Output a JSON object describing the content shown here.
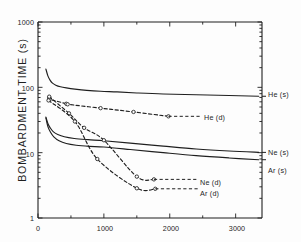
{
  "chart_data": {
    "type": "line",
    "title": "",
    "xlabel": "",
    "ylabel": "BOMBARDMENT TIME (s)",
    "xlim": [
      0,
      3400
    ],
    "ylim": [
      1,
      1000
    ],
    "yscale": "log",
    "xscale": "linear",
    "grid": false,
    "legend_position": "right-inline",
    "xticks": [
      0,
      1000,
      2000,
      3000
    ],
    "xtick_labels": [
      "0",
      "1000",
      "2000",
      "3000"
    ],
    "yticks": [
      1,
      10,
      100,
      1000
    ],
    "ytick_labels": [
      "1",
      "10",
      "100",
      "1000"
    ],
    "series": [
      {
        "name": "He (s)",
        "label": "He (s)",
        "style": "solid",
        "markers": false,
        "points": [
          [
            120,
            190
          ],
          [
            150,
            150
          ],
          [
            185,
            128
          ],
          [
            220,
            116
          ],
          [
            270,
            108
          ],
          [
            340,
            102
          ],
          [
            430,
            98
          ],
          [
            560,
            94
          ],
          [
            740,
            90
          ],
          [
            950,
            87
          ],
          [
            1200,
            85
          ],
          [
            1500,
            82
          ],
          [
            1900,
            79
          ],
          [
            2400,
            77
          ],
          [
            2900,
            75
          ],
          [
            3350,
            73
          ]
        ]
      },
      {
        "name": "He (d)",
        "label": "He (d)",
        "style": "dashed",
        "markers": true,
        "points": [
          [
            170,
            70
          ],
          [
            175,
            66
          ],
          [
            430,
            56
          ],
          [
            450,
            55
          ],
          [
            950,
            48
          ],
          [
            1450,
            42
          ],
          [
            1980,
            36
          ]
        ]
      },
      {
        "name": "Ne (s)",
        "label": "Ne (s)",
        "style": "solid",
        "markers": false,
        "points": [
          [
            120,
            35
          ],
          [
            150,
            28
          ],
          [
            185,
            24
          ],
          [
            230,
            21
          ],
          [
            300,
            19
          ],
          [
            400,
            17.5
          ],
          [
            550,
            16.5
          ],
          [
            760,
            15.8
          ],
          [
            1000,
            15.2
          ],
          [
            1400,
            14.0
          ],
          [
            1900,
            12.6
          ],
          [
            2400,
            11.4
          ],
          [
            2900,
            10.6
          ],
          [
            3350,
            10.1
          ]
        ]
      },
      {
        "name": "Ar (s)",
        "label": "Ar (s)",
        "style": "solid",
        "markers": false,
        "points": [
          [
            120,
            34
          ],
          [
            150,
            25
          ],
          [
            190,
            20.5
          ],
          [
            240,
            17.5
          ],
          [
            320,
            15.2
          ],
          [
            430,
            13.8
          ],
          [
            580,
            13.0
          ],
          [
            780,
            12.5
          ],
          [
            1000,
            12.2
          ],
          [
            1400,
            11.2
          ],
          [
            1900,
            10.0
          ],
          [
            2400,
            9.0
          ],
          [
            2900,
            8.3
          ],
          [
            3350,
            7.8
          ]
        ]
      },
      {
        "name": "Ne (d)",
        "label": "Ne (d)",
        "style": "dashed",
        "markers": true,
        "points": [
          [
            170,
            72
          ],
          [
            470,
            40
          ],
          [
            700,
            24
          ],
          [
            1000,
            15.5
          ],
          [
            1500,
            4.3
          ],
          [
            1760,
            3.9
          ]
        ]
      },
      {
        "name": "Ar (d)",
        "label": "Ar (d)",
        "style": "dashed",
        "markers": true,
        "points": [
          [
            160,
            63
          ],
          [
            560,
            30
          ],
          [
            900,
            8.0
          ],
          [
            1500,
            2.85
          ],
          [
            1780,
            2.8
          ]
        ]
      }
    ],
    "annotations": [
      {
        "text": "He (s)",
        "x": 3400,
        "y": 73
      },
      {
        "text": "He (d)",
        "x": 2050,
        "y": 36
      },
      {
        "text": "Ne (s)",
        "x": 3400,
        "y": 10.1
      },
      {
        "text": "Ar (s)",
        "x": 3400,
        "y": 7.8
      },
      {
        "text": "Ne (d)",
        "x": 1850,
        "y": 3.9
      },
      {
        "text": "Ar (d)",
        "x": 1850,
        "y": 2.8
      }
    ]
  },
  "axis": {
    "y_title": "BOMBARDMENT TIME (s)",
    "ytick_1000": "1000",
    "ytick_100": "100",
    "ytick_10": "10",
    "ytick_1": "1",
    "xtick_0": "0",
    "xtick_1000": "1000",
    "xtick_2000": "2000",
    "xtick_3000": "3000"
  },
  "labels": {
    "he_s": "He (s)",
    "he_d": "He (d)",
    "ne_s": "Ne (s)",
    "ar_s": "Ar (s)",
    "ne_d": "Ne (d)",
    "ar_d": "Ar (d)"
  },
  "colors": {
    "axis": "#1f1f1f",
    "curve": "#1f1f1f",
    "background": "#fdfdfd"
  }
}
